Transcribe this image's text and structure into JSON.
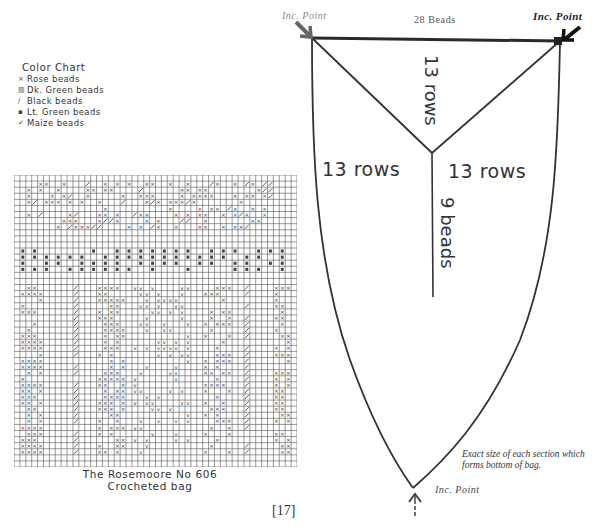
{
  "legend": {
    "title": "Color Chart",
    "items": [
      {
        "symbol": "×",
        "label": "Rose beads",
        "icon": "x-mark-icon"
      },
      {
        "symbol": "▥",
        "label": "Dk. Green beads",
        "icon": "filled-square-icon"
      },
      {
        "symbol": "/",
        "label": "Black beads",
        "icon": "slash-icon"
      },
      {
        "symbol": "▪",
        "label": "Lt. Green beads",
        "icon": "small-square-icon"
      },
      {
        "symbol": "✓",
        "label": "Maize beads",
        "icon": "check-icon"
      }
    ]
  },
  "chart": {
    "caption_line1": "The Rosemoore No 606",
    "caption_line2": "Crocheted bag",
    "grid_cols": 48,
    "grid_rows": 48
  },
  "diagram": {
    "top_left_label": "Inc. Point",
    "top_right_label": "Inc. Point",
    "bottom_label": "Inc. Point",
    "top_width_label": "28 Beads",
    "center_top_label": "13 rows",
    "left_label": "13 rows",
    "right_label": "13 rows",
    "vertical_label": "9 beads",
    "note": "Exact size of each section which forms bottom of bag."
  },
  "page": {
    "number": "[17]"
  }
}
